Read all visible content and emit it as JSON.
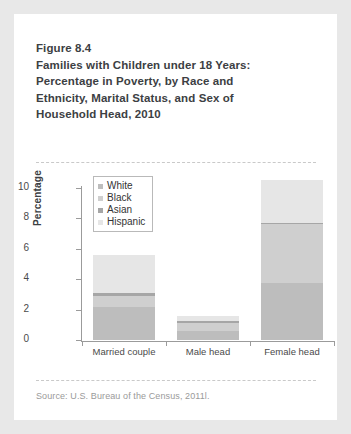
{
  "figure": {
    "title_lines": [
      "Figure 8.4",
      "Families with Children under 18 Years:",
      "Percentage in Poverty, by Race and",
      "Ethnicity, Marital Status, and Sex of",
      "Household Head, 2010"
    ],
    "source": "Source: U.S. Bureau of the Census, 2011l."
  },
  "chart_data": {
    "type": "bar",
    "title": "Families with Children under 18 Years: Percentage in Poverty, by Race and Ethnicity, Marital Status, and Sex of Household Head, 2010",
    "stacked": true,
    "categories": [
      "Married couple",
      "Male head",
      "Female head"
    ],
    "series": [
      {
        "name": "White",
        "color": "#bdbdbd",
        "values": [
          2.2,
          0.6,
          3.75
        ]
      },
      {
        "name": "Black",
        "color": "#cfcfcf",
        "values": [
          0.7,
          0.5,
          3.85
        ]
      },
      {
        "name": "Asian",
        "color": "#a6a6a6",
        "values": [
          0.2,
          0.15,
          0.1
        ]
      },
      {
        "name": "Hispanic",
        "color": "#e6e6e6",
        "values": [
          2.5,
          0.3,
          2.85
        ]
      }
    ],
    "totals": [
      5.6,
      1.55,
      10.55
    ],
    "xlabel": "",
    "ylabel": "Percentage",
    "ylim": [
      0,
      10
    ],
    "yticks": [
      0,
      2,
      4,
      6,
      8,
      10
    ],
    "ytick_labels": [
      "0",
      "2",
      "4",
      "6",
      "8",
      "10"
    ],
    "grid": false,
    "legend_position": "top-left",
    "legend_entries": [
      "White",
      "Black",
      "Asian",
      "Hispanic"
    ]
  },
  "colors": {
    "card_background": "#ffffff",
    "page_background": "#e8e8e8",
    "axis": "#9b9b9b",
    "title_text": "#3c4043",
    "source_text": "#9a9a9a",
    "rule": "#c9c9c9"
  }
}
